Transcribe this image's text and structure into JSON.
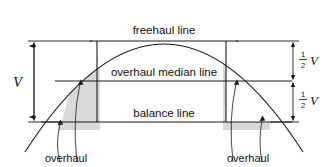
{
  "diagram": {
    "labels": {
      "freehaul_line": "freehaul line",
      "overhaul_median_line": "overhaul median line",
      "balance_line": "balance line",
      "overhaul_left": "overhaul",
      "overhaul_right": "overhaul"
    },
    "dimensions": {
      "total_height": "V",
      "upper_half_numerator": "1",
      "upper_half_denominator": "2",
      "upper_half_variable": "V",
      "lower_half_numerator": "1",
      "lower_half_denominator": "2",
      "lower_half_variable": "V"
    },
    "colors": {
      "line": "#1a1a1a",
      "shading": "#d9d9d9",
      "background": "#ffffff"
    },
    "geometry": {
      "curve_type": "parabola",
      "apex": [
        164,
        8
      ],
      "left_end": [
        25,
        152
      ],
      "right_end": [
        303,
        152
      ],
      "freehaul_line_y": 41,
      "median_line_y": 81,
      "balance_line_y": 122,
      "left_vertical_x": 97,
      "right_vertical_x": 226,
      "dimension_arrow_left_x": 34,
      "dimension_arrow_right_x": 293
    }
  }
}
